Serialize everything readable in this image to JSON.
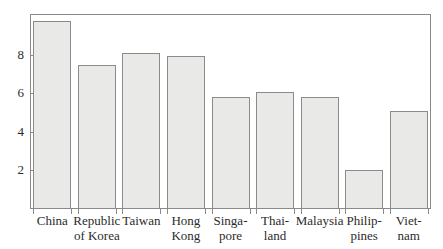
{
  "chart_data": {
    "type": "bar",
    "title": "",
    "subtitle": "",
    "xlabel": "",
    "ylabel": "",
    "categories": [
      "China",
      "Republic\nof Korea",
      "Taiwan",
      "Hong\nKong",
      "Singa-\npore",
      "Thai-\nland",
      "Malaysia",
      "Philip-\npines",
      "Viet-\nnam"
    ],
    "values": [
      9.75,
      7.45,
      8.1,
      7.9,
      5.8,
      6.05,
      5.8,
      2.0,
      5.1
    ],
    "ylim": [
      0,
      10.1
    ],
    "yticks": [
      2,
      4,
      6,
      8
    ],
    "ytick_labels": [
      "2",
      "4",
      "6",
      "8"
    ],
    "grid": false,
    "legend": false,
    "bar_fill_color": "#e9e9e7",
    "bar_border_color": "#8b8b8b",
    "axis_color": "#8a8a8a",
    "text_color": "#2b2b2b",
    "background_color": "#ffffff"
  }
}
